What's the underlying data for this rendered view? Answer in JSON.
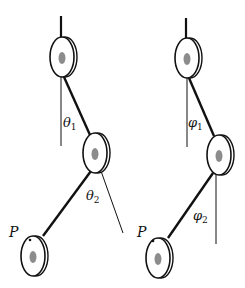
{
  "diagram": {
    "colors": {
      "stroke": "#111111",
      "disc_fill": "#ffffff",
      "hub_fill": "#8c8c8c",
      "background": "#ffffff"
    },
    "pendulums": [
      {
        "id": "left",
        "angle_1": {
          "symbol": "θ",
          "subscript": "1"
        },
        "angle_2": {
          "symbol": "θ",
          "subscript": "2"
        },
        "point_label": "P"
      },
      {
        "id": "right",
        "angle_1": {
          "symbol": "φ",
          "subscript": "1"
        },
        "angle_2": {
          "symbol": "φ",
          "subscript": "2"
        },
        "point_label": "P"
      }
    ]
  }
}
